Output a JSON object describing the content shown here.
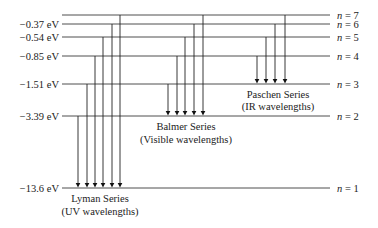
{
  "diagram": {
    "levels": [
      {
        "n": 7,
        "label": "n = 7",
        "energy": "",
        "y": 15
      },
      {
        "n": 6,
        "label": "n = 6",
        "energy": "−0.37 eV",
        "y": 24
      },
      {
        "n": 5,
        "label": "n = 5",
        "energy": "−0.54 eV",
        "y": 37
      },
      {
        "n": 4,
        "label": "n = 4",
        "energy": "−0.85 eV",
        "y": 56
      },
      {
        "n": 3,
        "label": "n = 3",
        "energy": "−1.51 eV",
        "y": 84
      },
      {
        "n": 2,
        "label": "n = 2",
        "energy": "−3.39 eV",
        "y": 116
      },
      {
        "n": 1,
        "label": "n = 1",
        "energy": "−13.6 eV",
        "y": 188
      }
    ],
    "series": [
      {
        "name": "Lyman Series",
        "sub": "(UV wavelengths)",
        "final_n": 1,
        "from_n": [
          2,
          3,
          4,
          5,
          6,
          7
        ],
        "x": [
          78,
          87,
          95,
          103,
          112,
          120
        ]
      },
      {
        "name": "Balmer Series",
        "sub": "(Visible wavelengths)",
        "final_n": 2,
        "from_n": [
          3,
          4,
          5,
          6,
          7
        ],
        "x": [
          168,
          177,
          185,
          194,
          203
        ]
      },
      {
        "name": "Paschen Series",
        "sub": "(IR wavelengths)",
        "final_n": 3,
        "from_n": [
          4,
          5,
          6,
          7
        ],
        "x": [
          257,
          266,
          275,
          285
        ]
      }
    ]
  }
}
